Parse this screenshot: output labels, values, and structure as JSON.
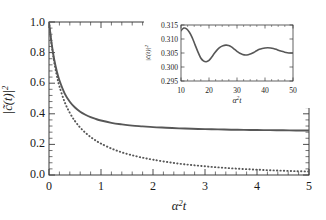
{
  "figure": {
    "background": "#ffffff",
    "line_color": "#575757",
    "frame_color": "#3a3a3a"
  },
  "chart_data": [
    {
      "type": "line",
      "id": "main-plot",
      "title": "",
      "xlabel": "α²t",
      "ylabel": "|c̃(t)|²",
      "xlim": [
        0,
        5
      ],
      "ylim": [
        0.0,
        1.0
      ],
      "xticks": [
        0,
        1,
        2,
        3,
        4,
        5
      ],
      "xticklabels": [
        "0",
        "1",
        "2",
        "3",
        "4",
        "5"
      ],
      "yticks": [
        0.0,
        0.2,
        0.4,
        0.6,
        0.8,
        1.0
      ],
      "yticklabels": [
        "0.0",
        "0.2",
        "0.4",
        "0.6",
        "0.8",
        "1.0"
      ],
      "grid": false,
      "legend": "none",
      "series": [
        {
          "name": "solid",
          "style": "solid",
          "color": "#575757",
          "x": [
            0.0,
            0.05,
            0.1,
            0.15,
            0.2,
            0.3,
            0.4,
            0.5,
            0.6,
            0.7,
            0.8,
            0.9,
            1.0,
            1.2,
            1.4,
            1.6,
            1.8,
            2.0,
            2.25,
            2.5,
            2.75,
            3.0,
            3.25,
            3.5,
            3.75,
            4.0,
            4.25,
            4.5,
            4.75,
            5.0
          ],
          "values": [
            1.0,
            0.86,
            0.755,
            0.678,
            0.619,
            0.534,
            0.479,
            0.441,
            0.414,
            0.394,
            0.378,
            0.366,
            0.356,
            0.341,
            0.331,
            0.323,
            0.318,
            0.313,
            0.309,
            0.305,
            0.302,
            0.3,
            0.298,
            0.296,
            0.295,
            0.294,
            0.293,
            0.292,
            0.291,
            0.291
          ]
        },
        {
          "name": "dotted",
          "style": "dotted",
          "color": "#575757",
          "x": [
            0.0,
            0.05,
            0.1,
            0.15,
            0.2,
            0.3,
            0.4,
            0.5,
            0.6,
            0.7,
            0.8,
            0.9,
            1.0,
            1.2,
            1.4,
            1.6,
            1.8,
            2.0,
            2.25,
            2.5,
            2.75,
            3.0,
            3.25,
            3.5,
            3.75,
            4.0,
            4.25,
            4.5,
            4.75,
            5.0
          ],
          "values": [
            1.0,
            0.852,
            0.738,
            0.65,
            0.58,
            0.478,
            0.406,
            0.352,
            0.31,
            0.276,
            0.248,
            0.225,
            0.205,
            0.173,
            0.148,
            0.129,
            0.113,
            0.1,
            0.086,
            0.074,
            0.065,
            0.057,
            0.05,
            0.044,
            0.039,
            0.035,
            0.031,
            0.028,
            0.025,
            0.023
          ]
        }
      ]
    },
    {
      "type": "line",
      "id": "inset-plot",
      "title": "",
      "xlabel": "α²t",
      "ylabel": "|c̃(t)|²",
      "xlim": [
        10,
        50
      ],
      "ylim": [
        0.295,
        0.315
      ],
      "xticks": [
        10,
        20,
        30,
        40,
        50
      ],
      "xticklabels": [
        "10",
        "20",
        "30",
        "40",
        "50"
      ],
      "yticks": [
        0.295,
        0.3,
        0.305,
        0.31,
        0.315
      ],
      "yticklabels": [
        "0.295",
        "0.300",
        "0.305",
        "0.310",
        "0.315"
      ],
      "grid": false,
      "legend": "none",
      "series": [
        {
          "name": "damped-oscillation",
          "style": "solid",
          "color": "#575757",
          "x": [
            10,
            11,
            12,
            13,
            14,
            15,
            16,
            17,
            18,
            19,
            20,
            21,
            22,
            23,
            24,
            25,
            26,
            27,
            28,
            29,
            30,
            31,
            32,
            33,
            34,
            35,
            36,
            37,
            38,
            39,
            40,
            41,
            42,
            43,
            44,
            45,
            46,
            47,
            48,
            49,
            50
          ],
          "values": [
            0.313,
            0.3139,
            0.3136,
            0.3124,
            0.3105,
            0.308,
            0.3055,
            0.3033,
            0.3022,
            0.3019,
            0.3024,
            0.3036,
            0.305,
            0.3062,
            0.3071,
            0.3076,
            0.3078,
            0.3077,
            0.3072,
            0.3064,
            0.3056,
            0.3049,
            0.3045,
            0.3043,
            0.3044,
            0.3047,
            0.3052,
            0.3058,
            0.3063,
            0.3066,
            0.3068,
            0.3069,
            0.3068,
            0.3066,
            0.3063,
            0.3059,
            0.3056,
            0.3053,
            0.3051,
            0.305,
            0.305
          ]
        }
      ]
    }
  ]
}
